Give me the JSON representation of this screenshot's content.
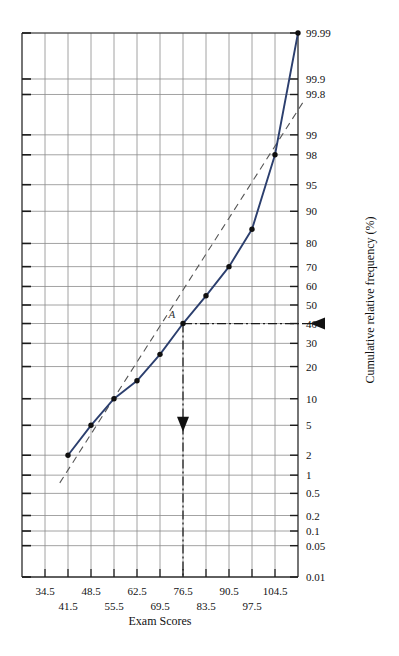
{
  "chart_data": {
    "type": "line",
    "title": "",
    "xlabel": "Exam Scores",
    "ylabel": "Cumulative relative frequency (%)",
    "x_ticklabels_row1": [
      "34.5",
      "48.5",
      "62.5",
      "76.5",
      "90.5",
      "104.5"
    ],
    "x_ticklabels_row2": [
      "41.5",
      "55.5",
      "69.5",
      "83.5",
      "97.5"
    ],
    "x_ticks_all": [
      "34.5",
      "41.5",
      "48.5",
      "55.5",
      "62.5",
      "69.5",
      "76.5",
      "83.5",
      "90.5",
      "97.5",
      "104.5"
    ],
    "y_ticklabels": [
      "99.99",
      "99.9",
      "99.8",
      "99",
      "98",
      "95",
      "90",
      "80",
      "70",
      "60",
      "50",
      "40",
      "30",
      "20",
      "10",
      "5",
      "2",
      "1",
      "0.5",
      "0.2",
      "0.1",
      "0.05",
      "0.01"
    ],
    "ylim": [
      0.01,
      99.99
    ],
    "xlim": [
      27.5,
      111.5
    ],
    "grid": true,
    "legend": false,
    "series": [
      {
        "name": "cumulative relative frequency (ogive, probability scale)",
        "style": "solid",
        "color": "#2c3f6e",
        "marker": "filled-circle",
        "points": [
          {
            "x": 41.5,
            "y": 2
          },
          {
            "x": 48.5,
            "y": 5
          },
          {
            "x": 55.5,
            "y": 10
          },
          {
            "x": 62.5,
            "y": 15
          },
          {
            "x": 69.5,
            "y": 25
          },
          {
            "x": 76.5,
            "y": 40
          },
          {
            "x": 83.5,
            "y": 55
          },
          {
            "x": 90.5,
            "y": 70
          },
          {
            "x": 97.5,
            "y": 85
          },
          {
            "x": 104.5,
            "y": 98
          },
          {
            "x": 111.5,
            "y": 99.99
          }
        ]
      },
      {
        "name": "reference straight line (normal fit)",
        "style": "dashed",
        "color": "#555555",
        "marker": "none",
        "points": [
          {
            "x": 39.0,
            "y": 0.75
          },
          {
            "x": 113.0,
            "y": 99.72
          }
        ]
      }
    ],
    "annotations": [
      {
        "label": "A",
        "type": "point-label",
        "x": 76.0,
        "y": 41.5
      },
      {
        "type": "dash-dot-leader-horizontal",
        "from_x": 76.5,
        "to_x": 112.0,
        "y": 40,
        "arrow": "left",
        "note": "reads off 40% on cumulative relative frequency axis"
      },
      {
        "type": "dash-dot-leader-vertical",
        "x": 76.5,
        "from_y": 40,
        "to_y": 0.01,
        "arrow": "down",
        "note": "drops to Exam Scores axis near 76.5"
      }
    ]
  },
  "axes": {
    "x_axis_title": "Exam Scores",
    "y_axis_title": "Cumulative relative frequency (%)"
  }
}
